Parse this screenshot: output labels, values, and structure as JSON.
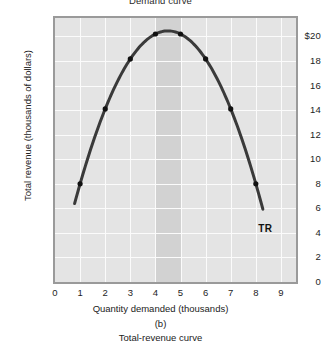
{
  "figure": {
    "top_caption": "Demand curve",
    "panel_letter": "(b)",
    "bottom_caption": "Total-revenue curve"
  },
  "chart_data": {
    "type": "line",
    "title": "Total-revenue curve",
    "xlabel": "Quantity demanded (thousands)",
    "ylabel": "Total revenue (thousands of dollars)",
    "xlim": [
      0,
      9.6
    ],
    "ylim": [
      0,
      21.5
    ],
    "grid": true,
    "legend_position": "inline-right",
    "series_label": "TR",
    "x_ticks": [
      "0",
      "1",
      "2",
      "3",
      "4",
      "5",
      "6",
      "7",
      "8",
      "9"
    ],
    "x_tick_values": [
      0,
      1,
      2,
      3,
      4,
      5,
      6,
      7,
      8,
      9
    ],
    "y_ticks": [
      "0",
      "2",
      "4",
      "6",
      "8",
      "10",
      "12",
      "14",
      "16",
      "18",
      "$20"
    ],
    "y_tick_values": [
      0,
      2,
      4,
      6,
      8,
      10,
      12,
      14,
      16,
      18,
      20
    ],
    "series": [
      {
        "name": "TR",
        "x": [
          1,
          2,
          3,
          4,
          5,
          6,
          7,
          8
        ],
        "values": [
          8,
          14,
          18,
          20,
          20,
          18,
          14,
          8
        ],
        "marker": "filled-circle",
        "color": "#3a3a3a"
      }
    ],
    "curve_extent": {
      "x_start": 0.78,
      "y_start": 5.0,
      "x_end": 8.28,
      "y_end": 5.0
    },
    "shaded_band": {
      "x_from": 4,
      "x_to": 5,
      "color": "#d2d2d2"
    },
    "plot_background": "#e4e4e4",
    "gridline_color": "#fbfbfb",
    "annotations": [
      {
        "text": "TR",
        "x": 8.1,
        "y": 4.3
      }
    ]
  }
}
